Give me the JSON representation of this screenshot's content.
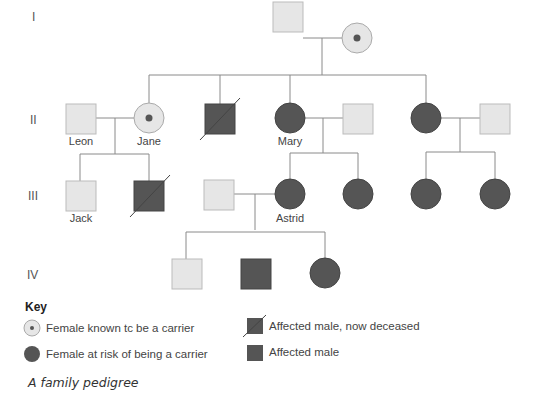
{
  "generations": [
    "I",
    "II",
    "III",
    "IV"
  ],
  "names": {
    "leon": "Leon",
    "jane": "Jane",
    "mary": "Mary",
    "jack": "Jack",
    "astrid": "Astrid"
  },
  "key": {
    "title": "Key",
    "items": [
      {
        "symbol": "carrier-female",
        "label": "Female known tc be a carrier"
      },
      {
        "symbol": "at-risk-female",
        "label": "Female at risk of being a carrier"
      },
      {
        "symbol": "affected-male-deceased",
        "label": "Affected male, now deceased"
      },
      {
        "symbol": "affected-male",
        "label": "Affected male"
      }
    ]
  },
  "caption": "A family pedigree",
  "colors": {
    "unaffected": "#e6e6e6",
    "affected": "#555555",
    "line": "#888888"
  }
}
